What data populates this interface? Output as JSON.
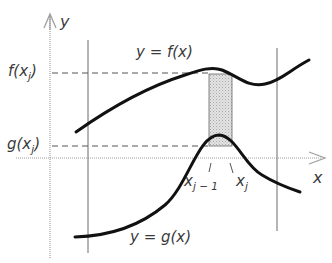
{
  "diagram": {
    "type": "area-between-curves",
    "axes": {
      "x_label": "x",
      "y_label": "y"
    },
    "curves": [
      {
        "name": "f",
        "label": "y = f(x)",
        "role": "upper"
      },
      {
        "name": "g",
        "label": "y = g(x)",
        "role": "lower"
      }
    ],
    "labels": {
      "f_label": "y = f(x)",
      "g_label": "y = g(x)",
      "f_xj": {
        "base": "f(x",
        "sub": "j",
        "close": ")"
      },
      "g_xj": {
        "base": "g(x",
        "sub": "j",
        "close": ")"
      },
      "x_j_minus_1": {
        "base": "x",
        "sub": "j − 1"
      },
      "x_j": {
        "base": "x",
        "sub": "j"
      }
    },
    "colors": {
      "curve": "#111111",
      "axis": "#9a9a9a",
      "bound_line": "#6a6a6a",
      "dash": "#555555",
      "strip_fill": "#d9d9d9",
      "text": "#3a3a3a"
    }
  }
}
